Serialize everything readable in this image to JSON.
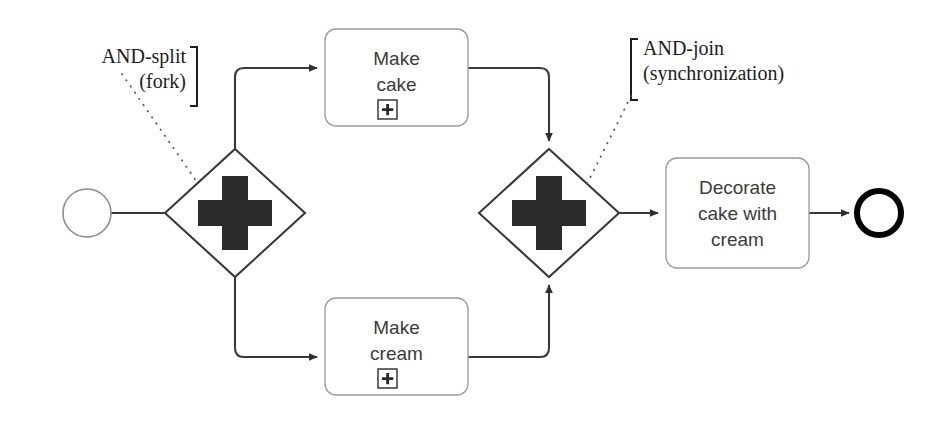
{
  "diagram": {
    "type": "bpmn-process",
    "background": "#ffffff",
    "colors": {
      "task_stroke": "#9a9a9a",
      "task_fill": "#ffffff",
      "task_text": "#3b3b3b",
      "gateway_stroke": "#3a3a3a",
      "gateway_marker": "#2b2b2b",
      "flow_stroke": "#3a3a3a",
      "start_event_stroke": "#8d8d8d",
      "end_event_stroke": "#000000",
      "annotation_text": "#1c1c1c",
      "leader_dots": "#555555"
    },
    "events": [
      {
        "id": "start-event",
        "name": "start-event",
        "shape": "circle",
        "label": "",
        "stroke_width": 1.6,
        "cx": 87,
        "cy": 213,
        "r": 24
      },
      {
        "id": "end-event",
        "name": "end-event",
        "shape": "circle",
        "label": "",
        "stroke_width": 6,
        "cx": 879,
        "cy": 213,
        "r": 22
      }
    ],
    "gateways": [
      {
        "id": "and-split",
        "name": "and-split-gateway",
        "marker": "plus",
        "label": "",
        "cx": 235,
        "cy": 213,
        "half_w": 70,
        "half_h": 64
      },
      {
        "id": "and-join",
        "name": "and-join-gateway",
        "marker": "plus",
        "label": "",
        "cx": 549,
        "cy": 213,
        "half_w": 70,
        "half_h": 64
      }
    ],
    "tasks": [
      {
        "id": "make-cake",
        "name": "task-make-cake",
        "label": "Make\ncake",
        "marker": "subprocess-plus",
        "x": 325,
        "y": 29,
        "w": 143,
        "h": 97
      },
      {
        "id": "make-cream",
        "name": "task-make-cream",
        "label": "Make\ncream",
        "marker": "subprocess-plus",
        "x": 325,
        "y": 298,
        "w": 143,
        "h": 97
      },
      {
        "id": "decorate-cake",
        "name": "task-decorate-cake-with-cream",
        "label": "Decorate\ncake with\ncream",
        "marker": "none",
        "x": 666,
        "y": 158,
        "w": 143,
        "h": 110
      }
    ],
    "annotations": [
      {
        "id": "and-split-annotation",
        "name": "and-split-annotation",
        "text": "AND-split\n(fork)",
        "bracket": "right",
        "x": 18,
        "y": 44,
        "w": 178
      },
      {
        "id": "and-join-annotation",
        "name": "and-join-annotation",
        "text": "AND-join\n(synchronization)",
        "bracket": "left",
        "x": 643,
        "y": 36,
        "w": 240
      }
    ],
    "flows": [
      {
        "id": "flow-start-to-split",
        "name": "flow-start-to-split"
      },
      {
        "id": "flow-split-to-make-cake",
        "name": "flow-split-to-make-cake"
      },
      {
        "id": "flow-split-to-make-cream",
        "name": "flow-split-to-make-cream"
      },
      {
        "id": "flow-make-cake-to-join",
        "name": "flow-make-cake-to-join"
      },
      {
        "id": "flow-make-cream-to-join",
        "name": "flow-make-cream-to-join"
      },
      {
        "id": "flow-join-to-decorate",
        "name": "flow-join-to-decorate"
      },
      {
        "id": "flow-decorate-to-end",
        "name": "flow-decorate-to-end"
      }
    ]
  }
}
